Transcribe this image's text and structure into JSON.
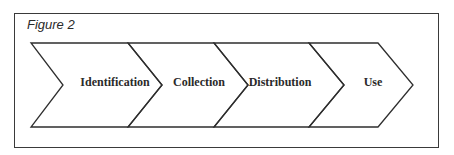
{
  "figure": {
    "title": "Figure 2",
    "stages": [
      {
        "label": "Identification"
      },
      {
        "label": "Collection"
      },
      {
        "label": "Distribution"
      },
      {
        "label": "Use"
      }
    ],
    "colors": {
      "stroke": "#2e2e2e",
      "background": "#ffffff",
      "text": "#2a2a2a"
    }
  }
}
